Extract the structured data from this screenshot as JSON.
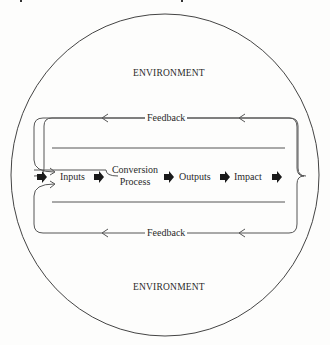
{
  "diagram": {
    "type": "systems-model",
    "environment_label_top": "ENVIRONMENT",
    "environment_label_bottom": "ENVIRONMENT",
    "feedback_top": "Feedback",
    "feedback_bottom": "Feedback",
    "flow": [
      {
        "id": "inputs",
        "label": "Inputs"
      },
      {
        "id": "conversion-process",
        "label_line1": "Conversion",
        "label_line2": "Process"
      },
      {
        "id": "outputs",
        "label": "Outputs"
      },
      {
        "id": "impact",
        "label": "Impact"
      }
    ],
    "colors": {
      "line": "#555555",
      "arrow_fill": "#1a1a1a",
      "text": "#2a2a2a",
      "background": "#fdfdfc"
    }
  }
}
